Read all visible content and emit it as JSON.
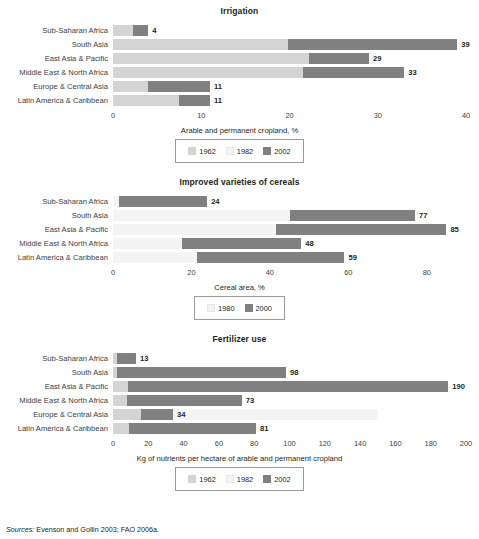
{
  "figure": {
    "sources_label": "Sources:",
    "sources_text": " Evenson and Gollin 2003; FAO 2006a."
  },
  "colors": {
    "series_1962": "#d4d4d4",
    "series_1982": "#f4f4f4",
    "series_2002": "#808080",
    "text": "#231f20",
    "axis_text": "#3d3d3d",
    "legend_border": "#9a9a9a"
  },
  "chart_data": [
    {
      "type": "bar",
      "orientation": "horizontal",
      "title": "Irrigation",
      "xlabel": "Arable and permanent cropland, %",
      "ylabel": "",
      "xlim": [
        0,
        40
      ],
      "xticks": [
        0,
        10,
        20,
        30,
        40
      ],
      "xticklabels": [
        "0",
        "10",
        "20",
        "30",
        "40"
      ],
      "grid": false,
      "legend_position": "bottom",
      "categories": [
        "Sub-Saharan Africa",
        "South Asia",
        "East Asia & Pacific",
        "Middle East & North Africa",
        "Europe & Central Asia",
        "Latin America & Caribbean"
      ],
      "series": [
        {
          "name": "1962",
          "values": [
            2.3,
            19.8,
            22.2,
            21.5,
            4.0,
            7.5
          ]
        },
        {
          "name": "1982",
          "values": [
            3.2,
            29.0,
            29.8,
            23.8,
            8.6,
            9.7
          ]
        },
        {
          "name": "2002",
          "values": [
            4,
            39,
            29,
            33,
            11,
            11
          ]
        }
      ],
      "labels": [
        "4",
        "39",
        "29",
        "33",
        "11",
        "11"
      ]
    },
    {
      "type": "bar",
      "orientation": "horizontal",
      "title": "Improved varieties of cereals",
      "xlabel": "Cereal area, %",
      "ylabel": "",
      "xlim": [
        0,
        90
      ],
      "xticks": [
        0,
        20,
        40,
        60,
        80
      ],
      "xticklabels": [
        "0",
        "20",
        "40",
        "60",
        "80"
      ],
      "grid": false,
      "legend_position": "bottom",
      "categories": [
        "Sub-Saharan Africa",
        "South Asia",
        "East Asia & Pacific",
        "Middle East & North Africa",
        "Latin America & Caribbean"
      ],
      "series": [
        {
          "name": "1980",
          "values": [
            1.5,
            45.0,
            41.5,
            17.5,
            21.5
          ]
        },
        {
          "name": "2000",
          "values": [
            24,
            77,
            85,
            48,
            59
          ]
        }
      ],
      "labels": [
        "24",
        "77",
        "85",
        "48",
        "59"
      ]
    },
    {
      "type": "bar",
      "orientation": "horizontal",
      "title": "Fertilizer use",
      "xlabel": "Kg of nutrients per hectare of arable and permanent cropland",
      "ylabel": "",
      "xlim": [
        0,
        200
      ],
      "xticks": [
        0,
        20,
        40,
        60,
        80,
        100,
        120,
        140,
        160,
        180,
        200
      ],
      "xticklabels": [
        "0",
        "20",
        "40",
        "60",
        "80",
        "100",
        "120",
        "140",
        "160",
        "180",
        "200"
      ],
      "grid": false,
      "legend_position": "bottom",
      "categories": [
        "Sub-Saharan Africa",
        "South Asia",
        "East Asia & Pacific",
        "Middle East & North Africa",
        "Europe & Central Asia",
        "Latin America & Caribbean"
      ],
      "series": [
        {
          "name": "1962",
          "values": [
            2.0,
            2.5,
            8.5,
            8.0,
            16.0,
            9.0
          ]
        },
        {
          "name": "1982",
          "values": [
            13.0,
            37.0,
            108.0,
            46.0,
            150.0,
            43.0
          ]
        },
        {
          "name": "2002",
          "values": [
            13,
            98,
            190,
            73,
            34,
            81
          ]
        }
      ],
      "labels": [
        "13",
        "98",
        "190",
        "73",
        "34",
        "81"
      ]
    }
  ],
  "legends": [
    {
      "items": [
        {
          "label": "1962",
          "swatch": "mid"
        },
        {
          "label": "1982",
          "swatch": "old"
        },
        {
          "label": "2002",
          "swatch": "new"
        }
      ]
    },
    {
      "items": [
        {
          "label": "1980",
          "swatch": "old"
        },
        {
          "label": "2000",
          "swatch": "new"
        }
      ]
    },
    {
      "items": [
        {
          "label": "1962",
          "swatch": "mid"
        },
        {
          "label": "1982",
          "swatch": "old"
        },
        {
          "label": "2002",
          "swatch": "new"
        }
      ]
    }
  ]
}
